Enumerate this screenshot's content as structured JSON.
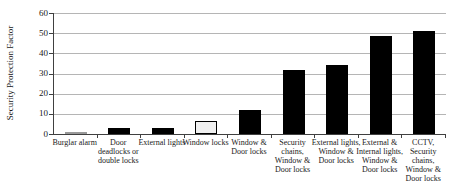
{
  "chart_data": {
    "type": "bar",
    "title": "",
    "xlabel": "",
    "ylabel": "Security Protection Factor",
    "ylim": [
      0,
      60
    ],
    "yticks": [
      0,
      10,
      20,
      30,
      40,
      50,
      60
    ],
    "grid": true,
    "legend": false,
    "categories": [
      "Burglar alarm",
      "Door deadlocks or double locks",
      "External lights",
      "Window locks",
      "Window & Door locks",
      "Security chains, Window & Door locks",
      "External lights, Window & Door locks",
      "External & Internal lights, Window & Door locks",
      "CCTV, Security chains, Window & Door locks"
    ],
    "category_label_lines": [
      [
        "Burglar alarm"
      ],
      [
        "Door",
        "deadlocks or",
        "double locks"
      ],
      [
        "External lights"
      ],
      [
        "Window locks"
      ],
      [
        "Window &",
        "Door locks"
      ],
      [
        "Security",
        "chains,",
        "Window &",
        "Door locks"
      ],
      [
        "External lights,",
        "Window &",
        "Door locks"
      ],
      [
        "External &",
        "Internal lights,",
        "Window &",
        "Door locks"
      ],
      [
        "CCTV,",
        "Security",
        "chains,",
        "Window &",
        "Door locks"
      ]
    ],
    "values": [
      1,
      3,
      3,
      6.5,
      12,
      31.5,
      34,
      48.5,
      51
    ],
    "bar_styles": [
      {
        "fill": "#b8b8b8",
        "border": "#9a9a9a"
      },
      {
        "fill": "#000000",
        "border": "#000000"
      },
      {
        "fill": "#000000",
        "border": "#000000"
      },
      {
        "fill": "#f0f0f0",
        "border": "#000000"
      },
      {
        "fill": "#000000",
        "border": "#000000"
      },
      {
        "fill": "#000000",
        "border": "#000000"
      },
      {
        "fill": "#000000",
        "border": "#000000"
      },
      {
        "fill": "#000000",
        "border": "#000000"
      },
      {
        "fill": "#000000",
        "border": "#000000"
      }
    ],
    "colors": {
      "gridline": "#b5b5b5",
      "axis": "#404040",
      "background": "#ffffff",
      "text": "#1a1a1a"
    }
  }
}
